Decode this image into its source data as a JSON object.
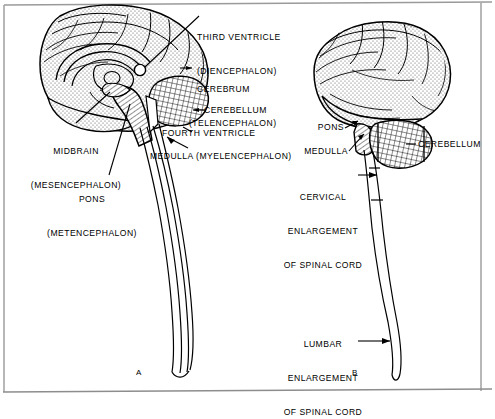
{
  "figure": {
    "background_color": "#ffffff",
    "ink_color": "#000000",
    "frame": {
      "top": "#9a9a9a",
      "left": "#9a9a9a",
      "right": "#9a9a9a",
      "bottom": "#8d8d8d"
    },
    "panels": [
      {
        "id": "A",
        "view": "midsagittal-section",
        "label": "A"
      },
      {
        "id": "B",
        "view": "lateral-external",
        "label": "B"
      }
    ]
  },
  "panel_a": {
    "id_label": "A",
    "labels": [
      {
        "name": "third-ventricle",
        "lines": [
          "THIRD VENTRICLE",
          "(DIENCEPHALON)"
        ],
        "align": "left"
      },
      {
        "name": "cerebrum",
        "lines": [
          "CEREBRUM",
          "(TELENCEPHALON)"
        ],
        "align": "left"
      },
      {
        "name": "cerebellum",
        "lines": [
          "CEREBELLUM"
        ],
        "align": "left"
      },
      {
        "name": "fourth-ventricle",
        "lines": [
          "FOURTH VENTRICLE"
        ],
        "align": "left"
      },
      {
        "name": "medulla",
        "lines": [
          "MEDULLA (MYELENCEPHALON)"
        ],
        "align": "left"
      },
      {
        "name": "midbrain",
        "lines": [
          "MIDBRAIN",
          "(MESENCEPHALON)"
        ],
        "align": "center"
      },
      {
        "name": "pons",
        "lines": [
          "PONS",
          "(METENCEPHALON)"
        ],
        "align": "center"
      }
    ]
  },
  "panel_b": {
    "id_label": "B",
    "labels": [
      {
        "name": "pons",
        "lines": [
          "PONS"
        ],
        "align": "right"
      },
      {
        "name": "medulla",
        "lines": [
          "MEDULLA"
        ],
        "align": "right"
      },
      {
        "name": "cerebellum",
        "lines": [
          "CEREBELLUM"
        ],
        "align": "left"
      },
      {
        "name": "cervical-enlargement",
        "lines": [
          "CERVICAL",
          "ENLARGEMENT",
          "OF SPINAL CORD"
        ],
        "align": "center"
      },
      {
        "name": "lumbar-enlargement",
        "lines": [
          "LUMBAR",
          "ENLARGEMENT",
          "OF SPINAL CORD"
        ],
        "align": "center"
      }
    ]
  },
  "text": {
    "a_third_ventricle_1": "THIRD VENTRICLE",
    "a_third_ventricle_2": "(DIENCEPHALON)",
    "a_cerebrum_1": "CEREBRUM",
    "a_cerebrum_2": "(TELENCEPHALON)",
    "a_cerebellum": "CEREBELLUM",
    "a_fourth_ventricle": "FOURTH VENTRICLE",
    "a_medulla": "MEDULLA (MYELENCEPHALON)",
    "a_midbrain_1": "MIDBRAIN",
    "a_midbrain_2": "(MESENCEPHALON)",
    "a_pons_1": "PONS",
    "a_pons_2": "(METENCEPHALON)",
    "a_panel_id": "A",
    "b_pons": "PONS",
    "b_medulla": "MEDULLA",
    "b_cerebellum": "CEREBELLUM",
    "b_cervical_1": "CERVICAL",
    "b_cervical_2": "ENLARGEMENT",
    "b_cervical_3": "OF SPINAL CORD",
    "b_lumbar_1": "LUMBAR",
    "b_lumbar_2": "ENLARGEMENT",
    "b_lumbar_3": "OF SPINAL CORD",
    "b_panel_id": "B"
  }
}
